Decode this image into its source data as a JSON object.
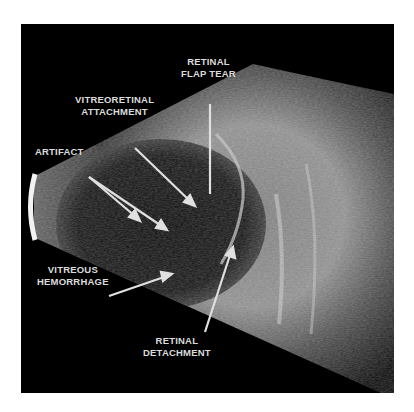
{
  "figure": {
    "type": "B-scan ocular ultrasound",
    "background": "#000000",
    "label_color": "#dcdcdc"
  },
  "labels": {
    "retinal_flap_tear": {
      "line1": "RETINAL",
      "line2": "FLAP TEAR"
    },
    "vitreoretinal_attachment": {
      "line1": "VITREORETINAL",
      "line2": "ATTACHMENT"
    },
    "artifact": {
      "line1": "ARTIFACT"
    },
    "vitreous_hemorrhage": {
      "line1": "VITREOUS",
      "line2": "HEMORRHAGE"
    },
    "retinal_detachment": {
      "line1": "RETINAL",
      "line2": "DETACHMENT"
    }
  }
}
